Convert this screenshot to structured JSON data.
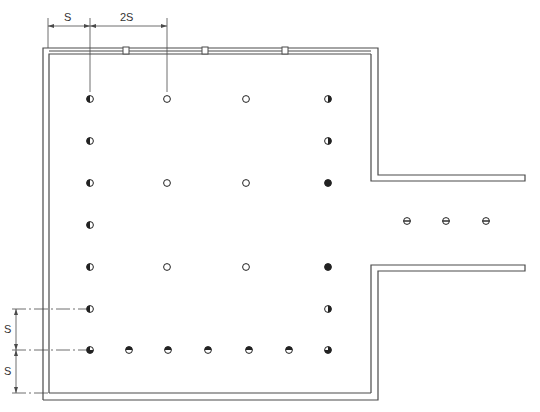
{
  "diagram": {
    "type": "lighting-layout-floor-plan",
    "colors": {
      "line": "#4a4a4a",
      "fill": "#222222",
      "background": "#ffffff"
    },
    "dimensions": {
      "top": [
        {
          "label": "S",
          "x1": 48,
          "x2": 90
        },
        {
          "label": "2S",
          "x1": 90,
          "x2": 167
        }
      ],
      "left": [
        {
          "label": "S",
          "y1": 309,
          "y2": 350
        },
        {
          "label": "S",
          "y1": 350,
          "y2": 393
        }
      ]
    },
    "window_mullions_x": [
      126,
      205,
      285
    ],
    "fixture_legend": {
      "half-left": "half shaded (left half dark)",
      "open": "open circle",
      "half-right": "half shaded (right half dark)",
      "three-quarter": "mostly shaded",
      "top-half": "top half shaded",
      "bar": "circle with horizontal bar"
    },
    "fixtures": [
      {
        "x": 90,
        "y": 99,
        "type": "half-left"
      },
      {
        "x": 167,
        "y": 99,
        "type": "open"
      },
      {
        "x": 246,
        "y": 99,
        "type": "open"
      },
      {
        "x": 328,
        "y": 99,
        "type": "half-right"
      },
      {
        "x": 90,
        "y": 141,
        "type": "half-left"
      },
      {
        "x": 328,
        "y": 141,
        "type": "half-right"
      },
      {
        "x": 90,
        "y": 183,
        "type": "half-left"
      },
      {
        "x": 167,
        "y": 183,
        "type": "open"
      },
      {
        "x": 246,
        "y": 183,
        "type": "open"
      },
      {
        "x": 328,
        "y": 183,
        "type": "three-quarter"
      },
      {
        "x": 90,
        "y": 225,
        "type": "half-left"
      },
      {
        "x": 90,
        "y": 267,
        "type": "half-left"
      },
      {
        "x": 167,
        "y": 267,
        "type": "open"
      },
      {
        "x": 246,
        "y": 267,
        "type": "open"
      },
      {
        "x": 328,
        "y": 267,
        "type": "three-quarter"
      },
      {
        "x": 90,
        "y": 309,
        "type": "half-left"
      },
      {
        "x": 328,
        "y": 309,
        "type": "half-right"
      },
      {
        "x": 90,
        "y": 350,
        "type": "corner-bl"
      },
      {
        "x": 129,
        "y": 350,
        "type": "top-half"
      },
      {
        "x": 168,
        "y": 350,
        "type": "top-half"
      },
      {
        "x": 208,
        "y": 350,
        "type": "top-half"
      },
      {
        "x": 249,
        "y": 350,
        "type": "top-half"
      },
      {
        "x": 289,
        "y": 350,
        "type": "top-half"
      },
      {
        "x": 328,
        "y": 350,
        "type": "corner-br"
      },
      {
        "x": 407,
        "y": 221,
        "type": "bar"
      },
      {
        "x": 446,
        "y": 221,
        "type": "bar"
      },
      {
        "x": 486,
        "y": 221,
        "type": "bar"
      }
    ]
  }
}
